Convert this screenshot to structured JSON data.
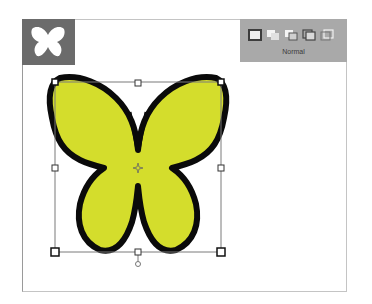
{
  "app_icon": {
    "name": "butterfly-icon",
    "bg_color": "#6b6b6b"
  },
  "drawing_modes": {
    "items": [
      {
        "name": "draw-normal",
        "selected": true
      },
      {
        "name": "draw-behind",
        "selected": false
      },
      {
        "name": "draw-inside",
        "selected": false
      },
      {
        "name": "draw-overlap",
        "selected": false
      },
      {
        "name": "draw-outline",
        "selected": false
      }
    ],
    "label": "Normal"
  },
  "artwork": {
    "shape": "butterfly",
    "fill_color": "#d4dd2c",
    "stroke_color": "#0a0a0a",
    "selected": true
  }
}
